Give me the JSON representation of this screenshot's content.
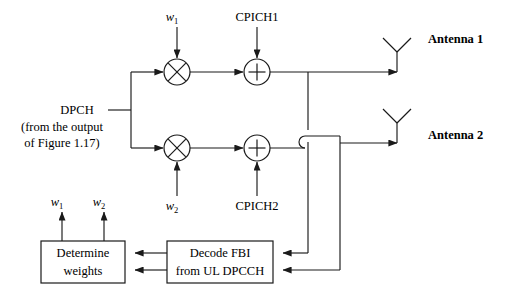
{
  "figure": {
    "kind": "block-diagram",
    "title_text": "",
    "background_color": "#ffffff",
    "line_color": "#1a1a1a",
    "text_color": "#000000"
  },
  "inputs": {
    "source_label_line1": "DPCH",
    "source_label_line2": "(from the output",
    "source_label_line3": "of Figure 1.17)"
  },
  "weight_inputs": {
    "top": {
      "symbol": "w",
      "subscript": "1"
    },
    "bottom": {
      "symbol": "w",
      "subscript": "2"
    }
  },
  "pilot_inputs": {
    "top": "CPICH1",
    "bottom": "CPICH2"
  },
  "nodes": {
    "multiplier_top": {
      "glyph": "multiply-circle",
      "name": "multiplier"
    },
    "multiplier_bottom": {
      "glyph": "multiply-circle",
      "name": "multiplier"
    },
    "adder_top": {
      "glyph": "plus-circle",
      "name": "adder"
    },
    "adder_bottom": {
      "glyph": "plus-circle",
      "name": "adder"
    }
  },
  "antennas": [
    {
      "label": "Antenna 1"
    },
    {
      "label": "Antenna 2"
    }
  ],
  "blocks": {
    "determine_weights": {
      "line1": "Determine",
      "line2": "weights"
    },
    "decode_fbi": {
      "line1": "Decode FBI",
      "line2": "from UL DPCCH"
    }
  },
  "weight_outputs": {
    "left": {
      "symbol": "w",
      "subscript": "1"
    },
    "right": {
      "symbol": "w",
      "subscript": "2"
    }
  }
}
